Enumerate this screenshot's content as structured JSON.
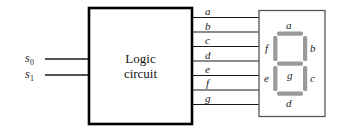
{
  "figure": {
    "type": "logic-diagram",
    "colors": {
      "line": "#1a1a1a",
      "box_border": "#000000",
      "display_border": "#555555",
      "segment_fill": "#9a9a9a",
      "background": "#ffffff",
      "text": "#1a1a1a"
    }
  },
  "inputs": {
    "label": "Select inputs",
    "items": [
      {
        "name": "s0",
        "base": "s",
        "sub": "0"
      },
      {
        "name": "s1",
        "base": "s",
        "sub": "1"
      }
    ]
  },
  "logic_block": {
    "name": "logic-circuit",
    "line1": "Logic",
    "line2": "circuit"
  },
  "outputs": {
    "label": "Segment drive outputs",
    "items": [
      {
        "name": "a",
        "label": "a"
      },
      {
        "name": "b",
        "label": "b"
      },
      {
        "name": "c",
        "label": "c"
      },
      {
        "name": "d",
        "label": "d"
      },
      {
        "name": "e",
        "label": "e"
      },
      {
        "name": "f",
        "label": "f"
      },
      {
        "name": "g",
        "label": "g"
      }
    ]
  },
  "display": {
    "name": "seven-segment-display",
    "segments": [
      {
        "name": "a",
        "label": "a",
        "position": "top"
      },
      {
        "name": "b",
        "label": "b",
        "position": "top-right"
      },
      {
        "name": "c",
        "label": "c",
        "position": "bottom-right"
      },
      {
        "name": "d",
        "label": "d",
        "position": "bottom"
      },
      {
        "name": "e",
        "label": "e",
        "position": "bottom-left"
      },
      {
        "name": "f",
        "label": "f",
        "position": "top-left"
      },
      {
        "name": "g",
        "label": "g",
        "position": "middle"
      }
    ]
  }
}
